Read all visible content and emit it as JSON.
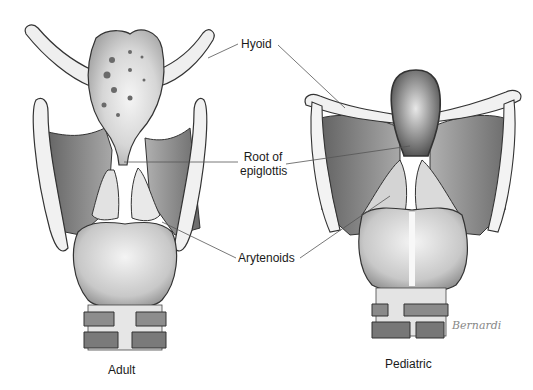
{
  "figure": {
    "type": "anatomical-illustration"
  },
  "labels": {
    "hyoid": "Hyoid",
    "root_line1": "Root of",
    "root_line2": "epiglottis",
    "arytenoids": "Arytenoids"
  },
  "captions": {
    "adult": "Adult",
    "pediatric": "Pediatric"
  },
  "signature": "Bernardi",
  "colors": {
    "ink": "#1a1a1a",
    "shade_dark": "#6b6b6b",
    "shade_mid": "#9a9a9a",
    "shade_light": "#d8d8d8",
    "bone": "#f2f2f2",
    "leader_line": "#555555"
  }
}
